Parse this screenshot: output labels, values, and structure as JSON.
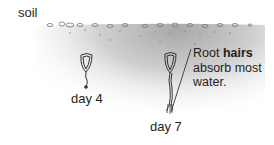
{
  "diagram": {
    "soil_label": "soil",
    "callout": {
      "text_prefix": "Root ",
      "text_bold": "hairs",
      "text_suffix": "absorb most water."
    },
    "seedlings": [
      {
        "label": "day 4"
      },
      {
        "label": "day 7"
      }
    ],
    "colors": {
      "soil_shade": "#b9b9b9",
      "ink": "#231f20",
      "background": "#ffffff"
    }
  }
}
